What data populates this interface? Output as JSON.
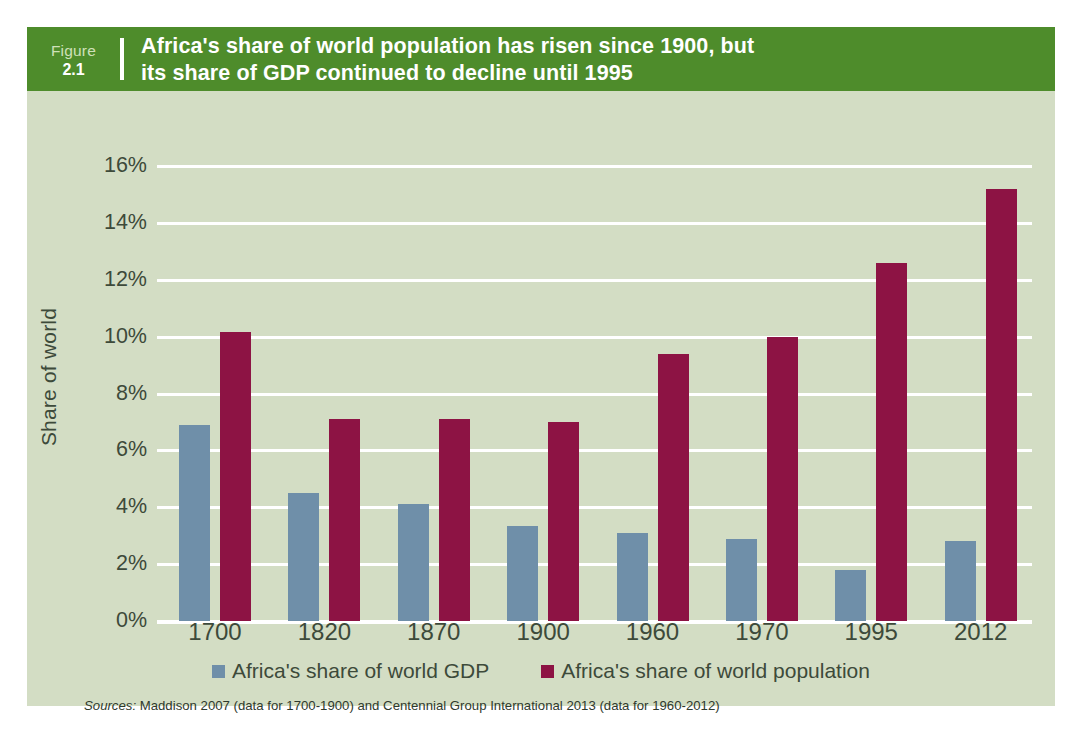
{
  "figure": {
    "label_word": "Figure",
    "label_number": "2.1",
    "title_line1": "Africa's share of world population has risen since 1900, but",
    "title_line2": "its share of GDP continued to decline until 1995"
  },
  "source": {
    "label": "Sources:",
    "text": " Maddison 2007 (data for 1700-1900) and Centennial Group International 2013 (data for 1960-2012)"
  },
  "colors": {
    "header_green": "#4e8c2b",
    "panel_background": "#d3ddc4",
    "gdp_blue": "#6f8fa9",
    "population_crimson": "#8d1344",
    "gridline_white": "#ffffff",
    "text_dark": "#3d4a3a"
  },
  "chart_data": {
    "type": "bar",
    "title": "Africa's share of world population has risen since 1900, but its share of GDP continued to decline until 1995",
    "xlabel": "",
    "ylabel": "Share of world",
    "ylim": [
      0,
      16
    ],
    "ytick_labels": [
      "0%",
      "2%",
      "4%",
      "6%",
      "8%",
      "10%",
      "12%",
      "14%",
      "16%"
    ],
    "ytick_values": [
      0,
      2,
      4,
      6,
      8,
      10,
      12,
      14,
      16
    ],
    "grid": true,
    "legend_position": "bottom",
    "categories": [
      "1700",
      "1820",
      "1870",
      "1900",
      "1960",
      "1970",
      "1995",
      "2012"
    ],
    "series": [
      {
        "name": "Africa's share of world GDP",
        "color": "#6f8fa9",
        "values": [
          6.9,
          4.5,
          4.1,
          3.35,
          3.1,
          2.9,
          1.8,
          2.8
        ]
      },
      {
        "name": "Africa's share of world population",
        "color": "#8d1344",
        "values": [
          10.15,
          7.1,
          7.1,
          7.0,
          9.4,
          10.0,
          12.6,
          15.2
        ]
      }
    ]
  }
}
